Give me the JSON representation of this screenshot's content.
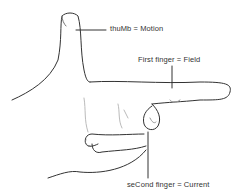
{
  "diagram": {
    "labels": {
      "thumb": "thuMb = Motion",
      "first_finger": "First finger = Field",
      "second_finger": "seCond finger = Current"
    },
    "colors": {
      "line": "#333333",
      "faint_line": "#aaaaaa",
      "background": "#ffffff"
    }
  }
}
